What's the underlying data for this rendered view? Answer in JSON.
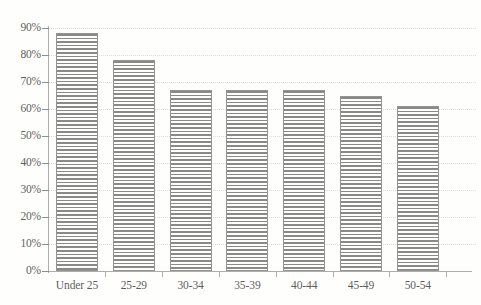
{
  "chart_data": {
    "type": "bar",
    "title": "",
    "subtitle": "",
    "xlabel": "",
    "ylabel": "",
    "categories": [
      "Under 25",
      "25-29",
      "30-34",
      "35-39",
      "40-44",
      "45-49",
      "50-54"
    ],
    "values": [
      88,
      78,
      67,
      67,
      67,
      65,
      61
    ],
    "value_suffix": "%",
    "ylim": [
      0,
      90
    ],
    "ytick_step": 10,
    "ytick_labels": [
      "0%",
      "10%",
      "20%",
      "30%",
      "40%",
      "50%",
      "60%",
      "70%",
      "80%",
      "90%"
    ],
    "ytick_values": [
      0,
      10,
      20,
      30,
      40,
      50,
      60,
      70,
      80,
      90
    ],
    "grid": true,
    "grid_orientation": "horizontal",
    "grid_style": "dotted",
    "legend": false,
    "legend_position": "none",
    "series": [
      {
        "name": "",
        "values": [
          88,
          78,
          67,
          67,
          67,
          65,
          61
        ]
      }
    ],
    "annotations": []
  },
  "style": {
    "bar_fill_pattern": "horizontal-hatch",
    "bar_line_color": "#5e5e5e",
    "bar_border_color": "#6b6b6b",
    "bar_background": "#ffffff",
    "grid_color": "#d2d2d2",
    "axis_color": "#8f8f8f",
    "text_color": "#1c1c1c",
    "page_background": "#ffffff"
  },
  "icons": {
    "none": ""
  }
}
